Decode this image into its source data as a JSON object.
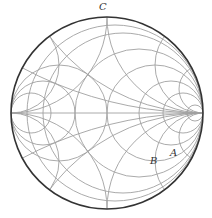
{
  "diagram": {
    "type": "smith-chart",
    "labels": [
      {
        "id": "C",
        "text": "C",
        "x": 99,
        "y": 10
      },
      {
        "id": "A",
        "text": "A",
        "x": 170,
        "y": 156
      },
      {
        "id": "B",
        "text": "B",
        "x": 150,
        "y": 164
      }
    ],
    "colors": {
      "outer": "#333333",
      "grid": "#9a9a9a"
    }
  }
}
